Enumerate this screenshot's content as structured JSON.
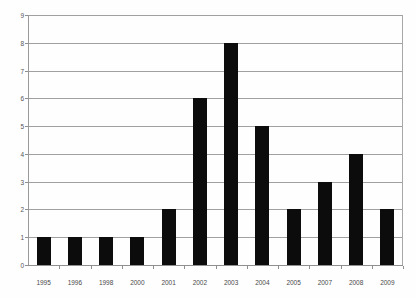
{
  "chart_data": {
    "type": "bar",
    "title": "",
    "subtitle": "",
    "xlabel": "",
    "ylabel": "",
    "categories": [
      "1995",
      "1996",
      "1998",
      "2000",
      "2001",
      "2002",
      "2003",
      "2004",
      "2005",
      "2007",
      "2008",
      "2009"
    ],
    "values": [
      1,
      1,
      1,
      1,
      2,
      6,
      8,
      5,
      2,
      3,
      4,
      2
    ],
    "ylim": [
      0,
      9
    ],
    "ytick_labels": [
      "0",
      "1",
      "2",
      "3",
      "4",
      "5",
      "6",
      "7",
      "8",
      "9"
    ],
    "ytick_step": 1,
    "grid": true,
    "grid_axis": "y",
    "legend": null,
    "legend_position": "none",
    "annotations": [],
    "bar_color": "#0c0c0c",
    "grid_color": "#a0a0a0",
    "axis_color": "#8f8f8f",
    "background_color": "#fefefe",
    "tick_label_color": "#4a4a4a"
  }
}
